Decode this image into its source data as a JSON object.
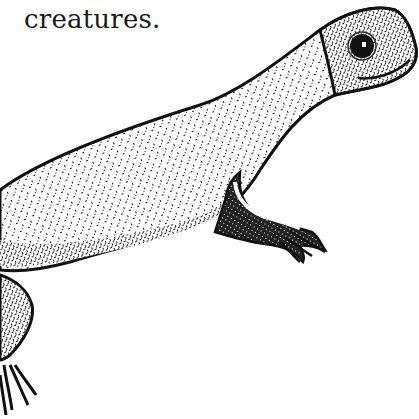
{
  "caption": {
    "text": "creatures."
  },
  "illustration": {
    "subject": "salamander",
    "style": "stippled pen-and-ink drawing",
    "ink_color": "#111111",
    "paper_color": "#ffffff"
  }
}
